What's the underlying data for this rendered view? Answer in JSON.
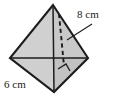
{
  "figure": {
    "type": "geometry-diagram",
    "shape_name": "square-pyramid",
    "caption": "",
    "labels": {
      "height_label": "8 cm",
      "base_edge_label": "6 cm"
    },
    "measurements": [
      {
        "name": "height",
        "value": 8,
        "unit": "cm",
        "text": "8 cm"
      },
      {
        "name": "base-edge",
        "value": 6,
        "unit": "cm",
        "text": "6 cm"
      }
    ],
    "markers": {
      "right_angle": "right-angle-marker"
    },
    "colors": {
      "face_light": "#d2d2d2",
      "face_mid": "#c6c6c6",
      "face_dark": "#bdbdbd",
      "outline": "#1c1c1c",
      "text": "#1a1a1a",
      "background": "#ffffff"
    },
    "geometry": {
      "apex": [
        53,
        5
      ],
      "left_vertex": [
        10,
        58
      ],
      "right_vertex": [
        88,
        58
      ],
      "bottom_vertex": [
        54,
        92
      ],
      "base_center": [
        53,
        58
      ]
    }
  }
}
